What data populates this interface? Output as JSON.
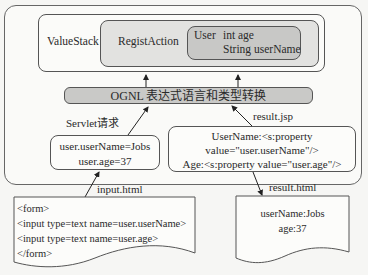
{
  "diagram": {
    "value_stack": {
      "label": "ValueStack",
      "action": {
        "label": "RegistAction",
        "model": {
          "class_name": "User",
          "fields": [
            "int age",
            "String userName"
          ]
        }
      }
    },
    "ognl_bar": {
      "label": "OGNL 表达式语言和类型转换"
    },
    "request_box": {
      "edge_label": "Servlet请求",
      "lines": [
        "user.userName=Jobs",
        "user.age=37"
      ]
    },
    "result_jsp_box": {
      "edge_label": "result.jsp",
      "lines": [
        "UserName:<s:property",
        "value=\"user.userName\"/>",
        "Age:<s:property value=\"user.age\"/>"
      ]
    },
    "input_doc": {
      "edge_label": "input.html",
      "lines": [
        "<form>",
        "<input type=text name=user.userName>",
        "<input type=text name=user.age>",
        "</form>"
      ]
    },
    "result_doc": {
      "edge_label": "result.html",
      "lines": [
        "userName:Jobs",
        "age:37"
      ]
    }
  },
  "colors": {
    "background": "#f6f6f4",
    "box_light": "#e2e2e0",
    "box_dark": "#c8c8c6",
    "ognl_bar": "#c9c9c7",
    "stroke": "#555555"
  }
}
